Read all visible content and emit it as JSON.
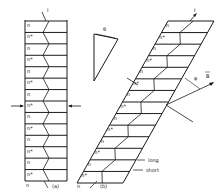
{
  "figure": {
    "panel_a": {
      "label": "(a)",
      "rows": [
        "n",
        "n*",
        "n",
        "n*",
        "n",
        "n*",
        "n",
        "n*",
        "n",
        "n*",
        "n",
        "n*",
        "n",
        "n*"
      ],
      "bottom_label": "n",
      "vector_label": "I",
      "arrows": "compression arrows pointing inward at left and right"
    },
    "triangle": {
      "angle_label": "θ"
    },
    "panel_b": {
      "label": "(b)",
      "rows": [
        "n",
        "n*",
        "n",
        "n*",
        "n",
        "n*",
        "n",
        "n*",
        "n",
        "n*",
        "n",
        "n*",
        "n",
        "n*"
      ],
      "bottom_label": "n",
      "vector_label": "I",
      "field_label": "B",
      "angle_label": "φ",
      "annotations": [
        "long",
        "short"
      ]
    }
  }
}
